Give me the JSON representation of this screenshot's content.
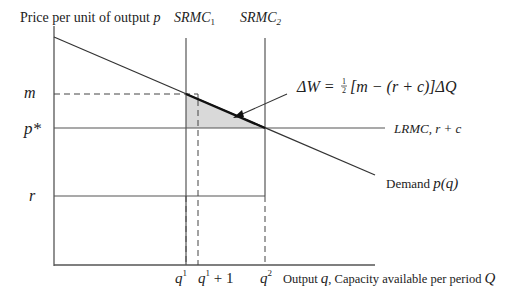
{
  "diagram": {
    "y_axis_label": "Price per unit of output",
    "y_axis_var": "p",
    "x_axis_label_prefix": "Output",
    "x_axis_var_q": "q",
    "x_axis_label_mid": ", Capacity available per period",
    "x_axis_var_Q": "Q",
    "srmc1_base": "SRMC",
    "srmc1_sub": "1",
    "srmc2_base": "SRMC",
    "srmc2_sub": "2",
    "price_labels": {
      "m": "m",
      "p_star": "p*",
      "r": "r"
    },
    "quantity_labels": {
      "q1": "q",
      "q1_sup": "1",
      "q1_plus_1": "q",
      "q1_plus_1_sup": "1",
      "q1_plus_1_suffix": " + 1",
      "q2": "q",
      "q2_sup": "2"
    },
    "lrmc_label": "LRMC, r + c",
    "demand_label": "Demand",
    "demand_func": "p(q)",
    "welfare_formula": {
      "lhs": "ΔW = ",
      "half_num": "1",
      "half_den": "2",
      "rhs": "[m − (r + c)]ΔQ"
    },
    "colors": {
      "line": "#333333",
      "shade": "#d9d9d9",
      "text": "#222222"
    }
  }
}
